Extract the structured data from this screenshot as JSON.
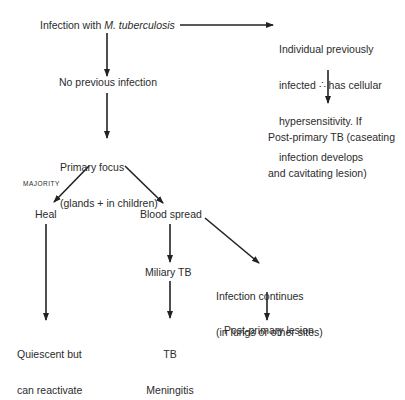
{
  "diagram": {
    "nodes": {
      "infection": {
        "prefix": "Infection with ",
        "italic": "M. tuberculosis"
      },
      "previously_infected": {
        "lines": [
          "Individual previously",
          "infected ∴ has cellular",
          "hypersensitivity. If",
          "infection develops"
        ]
      },
      "post_primary_tb": {
        "lines": [
          "Post-primary TB (caseating",
          "and cavitating lesion)"
        ]
      },
      "no_previous": {
        "label": "No previous infection"
      },
      "primary_focus": {
        "lines": [
          "Primary focus",
          "(glands + in children)"
        ]
      },
      "majority": {
        "label": "MAJORITY"
      },
      "heal": {
        "label": "Heal"
      },
      "blood_spread": {
        "label": "Blood spread"
      },
      "miliary_tb": {
        "label": "Miliary TB"
      },
      "infection_continues": {
        "lines": [
          "Infection continues",
          "(in lungs or other sites)"
        ]
      },
      "quiescent": {
        "lines": [
          "Quiescent but",
          "can reactivate"
        ]
      },
      "tb_meningitis": {
        "lines": [
          "TB",
          "Meningitis"
        ]
      },
      "post_primary_lesion": {
        "label": "Post-primary lesion"
      }
    },
    "edges": [
      {
        "from": "infection",
        "to": "previously_infected"
      },
      {
        "from": "infection",
        "to": "no_previous"
      },
      {
        "from": "previously_infected",
        "to": "post_primary_tb"
      },
      {
        "from": "no_previous",
        "to": "primary_focus"
      },
      {
        "from": "primary_focus",
        "to": "heal",
        "label": "MAJORITY"
      },
      {
        "from": "primary_focus",
        "to": "blood_spread"
      },
      {
        "from": "heal",
        "to": "quiescent"
      },
      {
        "from": "blood_spread",
        "to": "miliary_tb"
      },
      {
        "from": "blood_spread",
        "to": "infection_continues"
      },
      {
        "from": "miliary_tb",
        "to": "tb_meningitis"
      },
      {
        "from": "infection_continues",
        "to": "post_primary_lesion"
      }
    ],
    "colors": {
      "ink": "#2b2b2b",
      "background": "#ffffff"
    }
  }
}
